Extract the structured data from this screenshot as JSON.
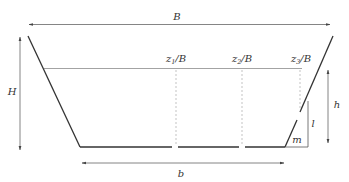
{
  "diagram": {
    "labels": {
      "top_width": "B",
      "total_height": "H",
      "water_depth": "h",
      "bottom_width": "b",
      "slope_vertical": "l",
      "slope_horizontal": "m"
    },
    "positions": [
      {
        "var": "z",
        "sub": "1",
        "suffix": "/B"
      },
      {
        "var": "z",
        "sub": "2",
        "suffix": "/B"
      },
      {
        "var": "z",
        "sub": "3",
        "suffix": "/B"
      }
    ],
    "colors": {
      "stroke": "#333333",
      "water_line": "#999999",
      "dashed": "#aaaaaa",
      "arrow": "#555555"
    }
  }
}
